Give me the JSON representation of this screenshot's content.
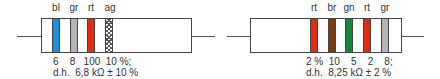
{
  "resistors": [
    {
      "bands": [
        {
          "code": "bl",
          "color": "#1a8fe0",
          "digit": "6"
        },
        {
          "code": "gr",
          "color": "#b4b4b4",
          "digit": "8"
        },
        {
          "code": "rt",
          "color": "#e52a12",
          "digit": "100"
        },
        {
          "code": "ag",
          "color": "hatched",
          "digit": "10 %;"
        }
      ],
      "values_line": "6    8   100  10 %;",
      "description": "d.h.  6,8 kΩ ± 10 %"
    },
    {
      "bands": [
        {
          "code": "rt",
          "color": "#e52a12",
          "digit": "2 %"
        },
        {
          "code": "br",
          "color": "#7a3d13",
          "digit": "10"
        },
        {
          "code": "gn",
          "color": "#15873a",
          "digit": "5"
        },
        {
          "code": "rt",
          "color": "#e52a12",
          "digit": "2"
        },
        {
          "code": "gr",
          "color": "#b4b4b4",
          "digit": "8;"
        }
      ],
      "values_line": "2 %  10    5    2    8;",
      "description": "d.h.  8,25 kΩ ± 2 %"
    }
  ]
}
